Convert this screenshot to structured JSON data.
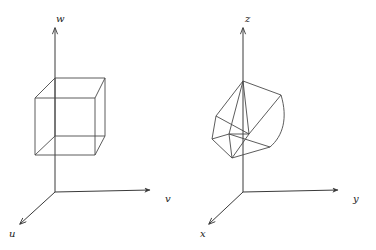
{
  "figure": {
    "background": "#ffffff",
    "line_color": "#3f3f3f",
    "label_color": "#1a1a1a",
    "panels": [
      {
        "id": "left-panel",
        "name": "undeformed-cube-uvw",
        "origin": [
          55,
          192
        ],
        "axes": [
          {
            "name": "u",
            "label": "u",
            "label_pos": [
              10,
              236
            ],
            "tip": [
              18,
              222
            ]
          },
          {
            "name": "v",
            "label": "v",
            "label_pos": [
              165,
              202
            ],
            "tip": [
              152,
              190
            ]
          },
          {
            "name": "w",
            "label": "w",
            "label_pos": [
              57,
              20
            ],
            "tip": [
              55,
              26
            ]
          }
        ],
        "shape": {
          "name": "cube",
          "description": "undeformed unit cube",
          "vertices": {
            "front_bottom_left": [
              35,
              155
            ],
            "front_bottom_right": [
              95,
              155
            ],
            "front_top_left": [
              35,
              98
            ],
            "front_top_right": [
              95,
              98
            ],
            "back_bottom_left": [
              55,
              136
            ],
            "back_bottom_right": [
              105,
              136
            ],
            "back_top_left": [
              55,
              78
            ],
            "back_top_right": [
              105,
              78
            ]
          }
        }
      },
      {
        "id": "right-panel",
        "name": "deformed-cube-xyz",
        "origin": [
          243,
          192
        ],
        "axes": [
          {
            "name": "x",
            "label": "x",
            "label_pos": [
              200,
              236
            ],
            "tip": [
              207,
              222
            ]
          },
          {
            "name": "y",
            "label": "y",
            "label_pos": [
              354,
              202
            ],
            "tip": [
              340,
              190
            ]
          },
          {
            "name": "z",
            "label": "z",
            "label_pos": [
              246,
              20
            ],
            "tip": [
              243,
              26
            ]
          }
        ],
        "shape": {
          "name": "deformed-cube",
          "description": "cube after deformation mapping, one edge curved",
          "vertices": {
            "v0": [
              216,
              116
            ],
            "v1": [
              249,
              134
            ],
            "v2": [
              232,
              158
            ],
            "v3": [
              212,
              139
            ],
            "v4": [
              243,
              81
            ],
            "v5": [
              281,
              95
            ],
            "v6": [
              270,
              147
            ],
            "v7": [
              229,
              134
            ]
          }
        }
      }
    ]
  }
}
